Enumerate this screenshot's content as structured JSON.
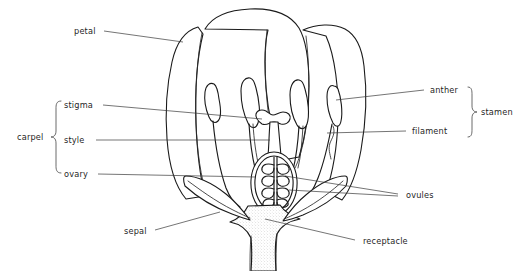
{
  "diagram": {
    "background_color": "#ffffff",
    "ink_color": "#1a1a1a",
    "leader_color": "#3a3a3a"
  },
  "labels": {
    "petal": "petal",
    "stigma": "stigma",
    "style": "style",
    "ovary": "ovary",
    "carpel": "carpel",
    "sepal": "sepal",
    "anther": "anther",
    "filament": "filament",
    "stamen": "stamen",
    "ovules": "ovules",
    "receptacle": "receptacle"
  },
  "structures": {
    "petal_count": 3,
    "stamen_count": 4,
    "ovule_rows": 4,
    "receptacle_shading": "stippled"
  }
}
